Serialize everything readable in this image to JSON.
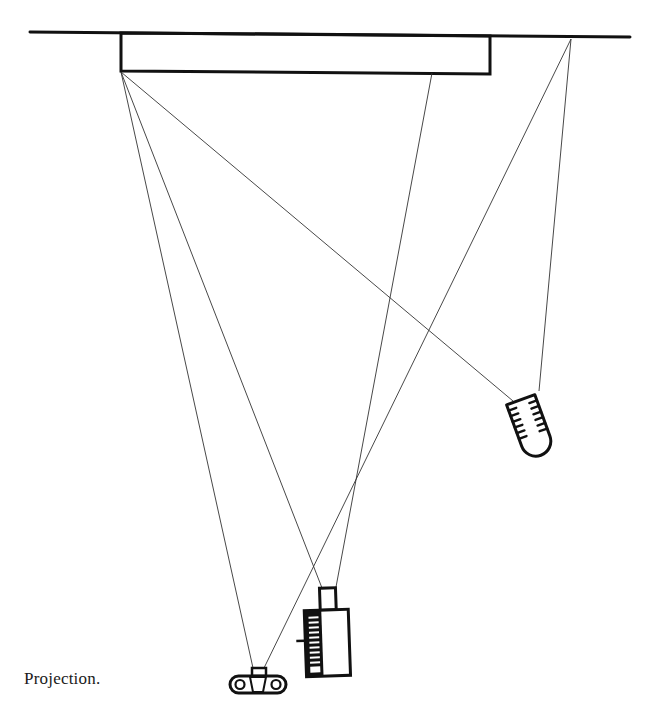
{
  "caption": "Projection.",
  "diagram": {
    "elements": [
      {
        "name": "ceiling-line",
        "label": "ceiling"
      },
      {
        "name": "screen",
        "label": "projection screen"
      },
      {
        "name": "lamp",
        "label": "light fixture"
      },
      {
        "name": "projector",
        "label": "projector"
      },
      {
        "name": "camera",
        "label": "camera"
      }
    ],
    "rays": [
      {
        "from": "screen-left-edge",
        "to": "projector"
      },
      {
        "from": "screen-left-edge",
        "to": "camera"
      },
      {
        "from": "screen-left-edge",
        "to": "lamp"
      },
      {
        "from": "screen-right-region",
        "to": "projector"
      },
      {
        "from": "ceiling-anchor",
        "to": "camera"
      },
      {
        "from": "ceiling-anchor",
        "to": "lamp"
      }
    ]
  },
  "colors": {
    "ink": "#111111",
    "ray": "#333333",
    "background": "#ffffff"
  }
}
